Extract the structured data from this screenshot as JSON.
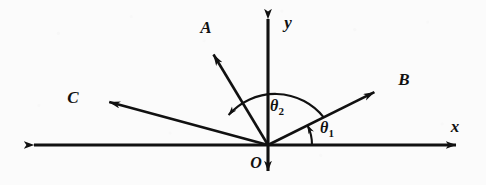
{
  "figure": {
    "kind": "vector-diagram",
    "background_color": "#fcfcfc",
    "ink_color": "#111111",
    "width": 486,
    "height": 185
  },
  "axes": {
    "origin_label": "O",
    "x_label": "x",
    "y_label": "y",
    "origin": {
      "x": 268,
      "y": 145
    },
    "x_axis": {
      "x1": 25,
      "y1": 145,
      "x2": 465,
      "y2": 145,
      "arrows": "both"
    },
    "y_axis": {
      "x1": 268,
      "y1": 10,
      "x2": 268,
      "y2": 180,
      "arrows": "both"
    }
  },
  "vectors": [
    {
      "label": "A",
      "from": {
        "x": 268,
        "y": 145
      },
      "to": {
        "x": 207,
        "y": 44
      },
      "label_pos": {
        "x": 206,
        "y": 27
      },
      "quadrant": "second",
      "approx_angle_deg": 121
    },
    {
      "label": "B",
      "from": {
        "x": 268,
        "y": 145
      },
      "to": {
        "x": 385,
        "y": 87
      },
      "label_pos": {
        "x": 404,
        "y": 79
      },
      "quadrant": "first",
      "approx_angle_deg": 26
    },
    {
      "label": "C",
      "from": {
        "x": 268,
        "y": 145
      },
      "to": {
        "x": 98,
        "y": 99
      },
      "label_pos": {
        "x": 73,
        "y": 97
      },
      "quadrant": "second",
      "approx_angle_deg": 165
    }
  ],
  "angles": [
    {
      "name": "theta-1",
      "symbol": "θ",
      "subscript": "1",
      "label_pos": {
        "x": 326,
        "y": 127
      },
      "from_ray": "x-axis",
      "to_ray": "B",
      "radius": 44,
      "direction": "counterclockwise",
      "arrow_at": "end"
    },
    {
      "name": "theta-2",
      "symbol": "θ",
      "subscript": "2",
      "label_pos": {
        "x": 275,
        "y": 107
      },
      "from_ray": "B",
      "to_ray": "A",
      "radius": 62,
      "direction": "counterclockwise",
      "arrow_at": "end"
    }
  ]
}
